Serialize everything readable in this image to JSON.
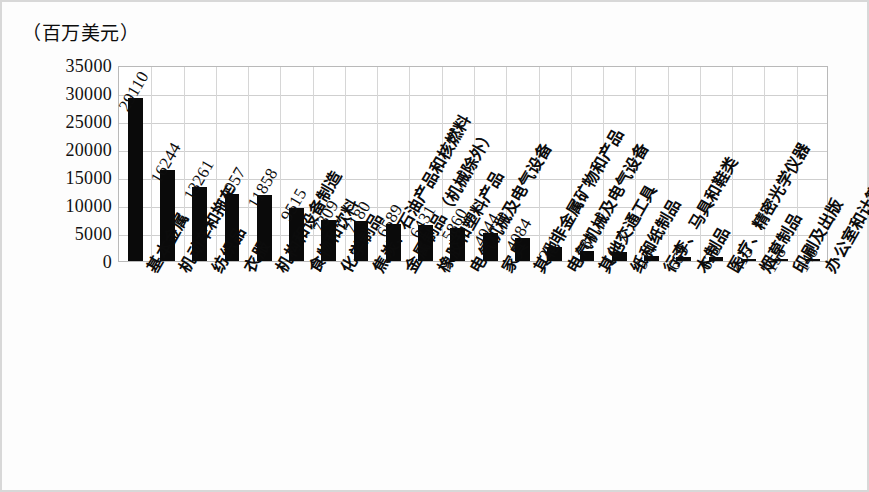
{
  "chart_data": {
    "type": "bar",
    "title": "",
    "subtitle": "",
    "ylabel": "（百万美元）",
    "xlabel": "",
    "ylim": [
      0,
      35000
    ],
    "ytick_step": 5000,
    "yticks": [
      "35000",
      "30000",
      "25000",
      "20000",
      "15000",
      "10000",
      "5000",
      "0"
    ],
    "grid": true,
    "legend": false,
    "bar_color": "#0a0a0a",
    "categories": [
      "基本金属",
      "机动车和拖车",
      "纺织品",
      "衣服",
      "机构和设备制造",
      "食物和饮料",
      "化学制品",
      "焦炭、石油产品和核燃料",
      "金属制品（机械除外）",
      "橡胶和塑料产品",
      "电气机械及电气设备",
      "家具",
      "其他非金属矿物和产品",
      "电气机械及电气设备",
      "其他交通工具",
      "纸和纸制品",
      "行李、马具和鞋类",
      "木制品",
      "医疗、精密光学仪器",
      "烟草制品",
      "印刷及出版",
      "办公室和计算机机械"
    ],
    "values": [
      29110,
      16244,
      13261,
      11957,
      11858,
      9515,
      7309,
      7180,
      6589,
      6431,
      5860,
      4944,
      4084,
      2511,
      1781,
      1647,
      914,
      659,
      628,
      415,
      158,
      148
    ],
    "value_labels": [
      "29110",
      "16244",
      "13261",
      "11957",
      "11858",
      "9515",
      "7309",
      "7180",
      "6589",
      "6431",
      "5860",
      "4944",
      "4084",
      "2511",
      "1781",
      "1647",
      "914",
      "659",
      "628",
      "415",
      "158",
      "148"
    ]
  }
}
